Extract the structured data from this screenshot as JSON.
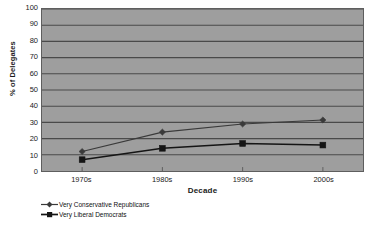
{
  "chart_data": {
    "type": "line",
    "title": "",
    "xlabel": "Decade",
    "ylabel": "% of Delegates",
    "categories": [
      "1970s",
      "1980s",
      "1990s",
      "2000s"
    ],
    "series": [
      {
        "name": "Very Conservative Republicans",
        "marker": "diamond",
        "color": "#3a3a3a",
        "values": [
          12,
          24,
          29,
          31.5
        ]
      },
      {
        "name": "Very Liberal Democrats",
        "marker": "square",
        "color": "#151515",
        "values": [
          7,
          14,
          17,
          16
        ]
      }
    ],
    "ylim": [
      0,
      100
    ],
    "ytick_step": 10,
    "yticks": [
      100,
      90,
      80,
      70,
      60,
      50,
      40,
      30,
      20,
      10,
      0
    ],
    "grid": true,
    "grid_axis": "y",
    "legend_position": "below-left",
    "plot_background": "#9e9e9e",
    "gridline_color": "#4a4a4a",
    "figure_background": "#ffffff"
  },
  "legend": {
    "entries": [
      {
        "label": "Very Conservative Republicans"
      },
      {
        "label": "Very Liberal Democrats"
      }
    ]
  }
}
